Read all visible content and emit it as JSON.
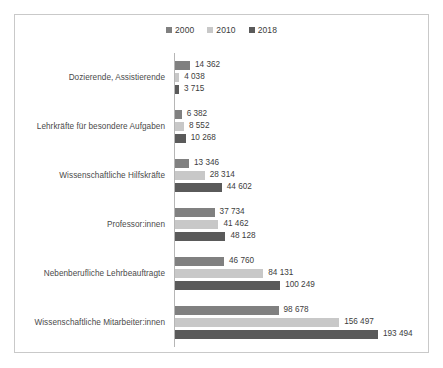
{
  "chart_data": {
    "type": "bar",
    "orientation": "horizontal",
    "title": "",
    "subtitle": "",
    "xlabel": "",
    "ylabel": "",
    "grid": false,
    "legend_position": "top-center",
    "xlim": [
      0,
      193494
    ],
    "categories": [
      "Dozierende, Assistierende",
      "Lehrkräfte für besondere Aufgaben",
      "Wissenschaftliche Hilfskräfte",
      "Professor:innen",
      "Nebenberufliche Lehrbeauftragte",
      "Wissenschaftliche Mitarbeiter:innen"
    ],
    "series": [
      {
        "name": "2000",
        "color": "#808080",
        "values": [
          14362,
          6382,
          13346,
          37734,
          46760,
          98678
        ],
        "labels": [
          "14 362",
          "6 382",
          "13 346",
          "37 734",
          "46 760",
          "98 678"
        ]
      },
      {
        "name": "2010",
        "color": "#c8c8c8",
        "values": [
          4038,
          8552,
          28314,
          41462,
          84131,
          156497
        ],
        "labels": [
          "4 038",
          "8 552",
          "28 314",
          "41 462",
          "84 131",
          "156 497"
        ]
      },
      {
        "name": "2018",
        "color": "#5a5a5a",
        "values": [
          3715,
          10268,
          44602,
          48128,
          100249,
          193494
        ],
        "labels": [
          "3 715",
          "10 268",
          "44 602",
          "48 128",
          "100 249",
          "193 494"
        ]
      }
    ]
  },
  "legend": {
    "entries": [
      {
        "label": "2000",
        "color": "#808080"
      },
      {
        "label": "2010",
        "color": "#c8c8c8"
      },
      {
        "label": "2018",
        "color": "#5a5a5a"
      }
    ]
  },
  "caption": {
    "text": ""
  }
}
